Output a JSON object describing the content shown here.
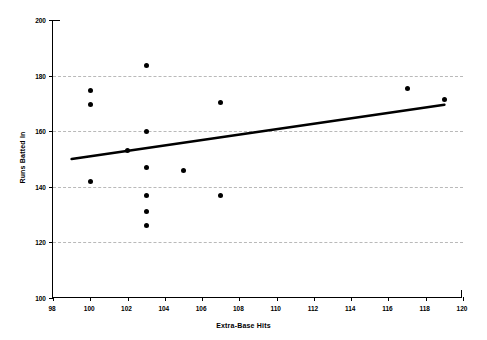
{
  "chart_data": {
    "type": "scatter",
    "title": "",
    "xlabel": "Extra-Base Hits",
    "ylabel": "Runs Batted In",
    "xlim": [
      98,
      120
    ],
    "ylim": [
      100,
      200
    ],
    "xticks": [
      98,
      100,
      102,
      104,
      106,
      108,
      110,
      112,
      114,
      116,
      118,
      120
    ],
    "yticks": [
      100,
      120,
      140,
      160,
      180,
      200
    ],
    "grid": "horizontal-dashed",
    "legend": "none",
    "points": [
      {
        "x": 100,
        "y": 174.5
      },
      {
        "x": 100,
        "y": 169.5
      },
      {
        "x": 100,
        "y": 142
      },
      {
        "x": 102,
        "y": 153
      },
      {
        "x": 103,
        "y": 183.5
      },
      {
        "x": 103,
        "y": 160
      },
      {
        "x": 103,
        "y": 147
      },
      {
        "x": 103,
        "y": 137
      },
      {
        "x": 103,
        "y": 131
      },
      {
        "x": 103,
        "y": 126
      },
      {
        "x": 105,
        "y": 146
      },
      {
        "x": 107,
        "y": 170.5
      },
      {
        "x": 107,
        "y": 137
      },
      {
        "x": 117,
        "y": 175.5
      },
      {
        "x": 119,
        "y": 171.5
      }
    ],
    "trendline": {
      "label": "linear-fit",
      "x_start": 99,
      "y_start": 150,
      "x_end": 119,
      "y_end": 169.5,
      "color": "#000000",
      "width": 2.6
    },
    "marker": {
      "shape": "circle",
      "color": "#000000",
      "size": 5
    },
    "colors": {
      "axis": "#000000",
      "grid": "#b9b9b9",
      "background": "#ffffff",
      "text": "#000000"
    }
  }
}
